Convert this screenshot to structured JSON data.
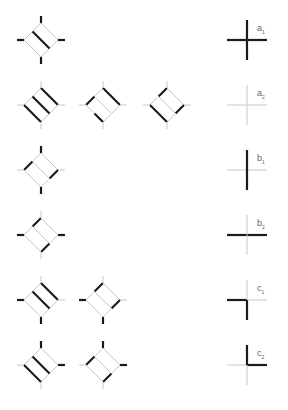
{
  "colors": {
    "thin": "#c8c8c8",
    "thick": "#1a1a1a",
    "label": "#666666"
  },
  "rows": [
    {
      "y": 40,
      "label": "a",
      "sub": "1",
      "diamonds": [
        {
          "x": 41,
          "bold": [
            "mid"
          ],
          "stubs": {
            "t": "b",
            "b": "b",
            "l": "b",
            "r": "b"
          }
        }
      ],
      "cross": {
        "bold": [
          "h",
          "v"
        ]
      }
    },
    {
      "y": 105,
      "label": "a",
      "sub": "2",
      "diamonds": [
        {
          "x": 41,
          "bold": [
            "tr",
            "mid",
            "bl"
          ],
          "stubs": {
            "t": "t",
            "b": "t",
            "l": "t",
            "r": "t"
          }
        },
        {
          "x": 103,
          "bold": [
            "tr",
            "bl_lo",
            "tl_lo"
          ],
          "stubs": {
            "t": "t",
            "b": "t",
            "l": "t",
            "r": "t"
          }
        },
        {
          "x": 167,
          "bold": [
            "tl_up",
            "br_up",
            "bl"
          ],
          "stubs": {
            "t": "t",
            "b": "t",
            "l": "t",
            "r": "t"
          }
        }
      ],
      "cross": {
        "bold": []
      }
    },
    {
      "y": 170,
      "label": "b",
      "sub": "1",
      "diamonds": [
        {
          "x": 41,
          "bold": [
            "tl_lo",
            "br_up"
          ],
          "stubs": {
            "t": "b",
            "b": "b",
            "l": "t",
            "r": "t"
          }
        }
      ],
      "cross": {
        "bold": [
          "v"
        ]
      }
    },
    {
      "y": 235,
      "label": "b",
      "sub": "2",
      "diamonds": [
        {
          "x": 41,
          "bold": [
            "tl_up",
            "br_lo"
          ],
          "stubs": {
            "t": "t",
            "b": "t",
            "l": "b",
            "r": "b"
          }
        }
      ],
      "cross": {
        "bold": [
          "h"
        ]
      }
    },
    {
      "y": 300,
      "label": "c",
      "sub": "1",
      "diamonds": [
        {
          "x": 41,
          "bold": [
            "tr",
            "mid"
          ],
          "stubs": {
            "t": "t",
            "b": "b",
            "l": "b",
            "r": "t"
          }
        },
        {
          "x": 103,
          "bold": [
            "tl_up",
            "br_up"
          ],
          "stubs": {
            "t": "t",
            "b": "b",
            "l": "b",
            "r": "t"
          }
        }
      ],
      "cross": {
        "bold": [
          "l",
          "d"
        ]
      }
    },
    {
      "y": 365,
      "label": "c",
      "sub": "2",
      "diamonds": [
        {
          "x": 41,
          "bold": [
            "bl",
            "mid"
          ],
          "stubs": {
            "t": "b",
            "b": "t",
            "l": "t",
            "r": "b"
          }
        },
        {
          "x": 103,
          "bold": [
            "tl_lo",
            "br_lo"
          ],
          "stubs": {
            "t": "b",
            "b": "t",
            "l": "t",
            "r": "b"
          }
        }
      ],
      "cross": {
        "bold": [
          "u",
          "r"
        ]
      }
    }
  ],
  "cross_x": 247,
  "labels": [
    {
      "text": "a",
      "sub": "1"
    },
    {
      "text": "a",
      "sub": "2"
    },
    {
      "text": "b",
      "sub": "1"
    },
    {
      "text": "b",
      "sub": "2"
    },
    {
      "text": "c",
      "sub": "1"
    },
    {
      "text": "c",
      "sub": "2"
    }
  ]
}
